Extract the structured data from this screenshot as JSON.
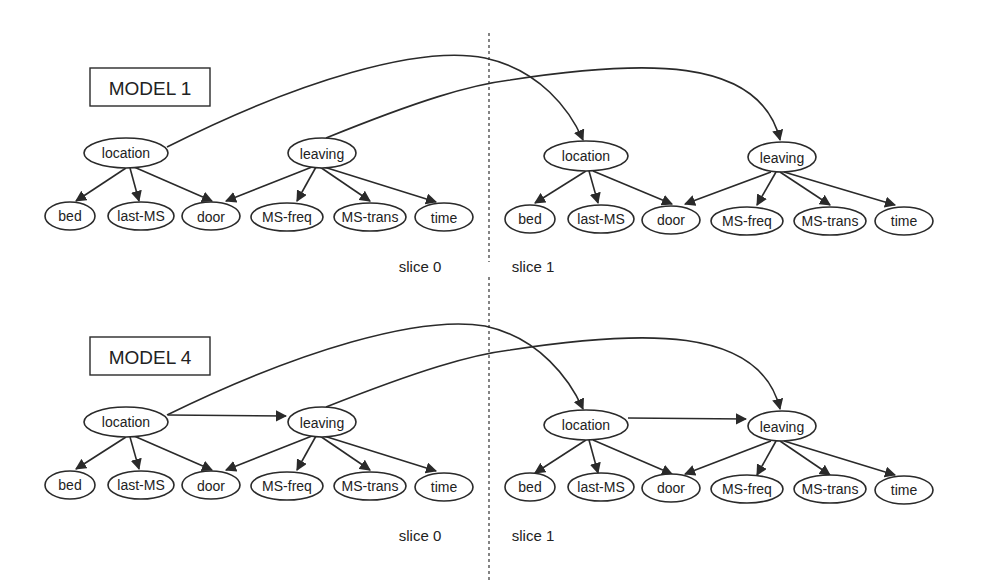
{
  "diagram": {
    "type": "dynamic-bayesian-network",
    "models": [
      {
        "id": "model1",
        "title": "MODEL 1",
        "slices": [
          {
            "label": "slice 0"
          },
          {
            "label": "slice 1"
          }
        ],
        "parent_nodes": [
          "location",
          "leaving"
        ],
        "child_nodes": [
          "bed",
          "last-MS",
          "door",
          "MS-freq",
          "MS-trans",
          "time"
        ],
        "intra_slice_edges": [
          [
            "location",
            "bed"
          ],
          [
            "location",
            "last-MS"
          ],
          [
            "location",
            "door"
          ],
          [
            "leaving",
            "door"
          ],
          [
            "leaving",
            "MS-freq"
          ],
          [
            "leaving",
            "MS-trans"
          ],
          [
            "leaving",
            "time"
          ]
        ],
        "inter_slice_edges": [
          [
            "location@0",
            "location@1"
          ],
          [
            "leaving@0",
            "leaving@1"
          ]
        ]
      },
      {
        "id": "model4",
        "title": "MODEL 4",
        "slices": [
          {
            "label": "slice 0"
          },
          {
            "label": "slice 1"
          }
        ],
        "parent_nodes": [
          "location",
          "leaving"
        ],
        "child_nodes": [
          "bed",
          "last-MS",
          "door",
          "MS-freq",
          "MS-trans",
          "time"
        ],
        "intra_slice_edges": [
          [
            "location",
            "leaving"
          ],
          [
            "location",
            "bed"
          ],
          [
            "location",
            "last-MS"
          ],
          [
            "location",
            "door"
          ],
          [
            "leaving",
            "door"
          ],
          [
            "leaving",
            "MS-freq"
          ],
          [
            "leaving",
            "MS-trans"
          ],
          [
            "leaving",
            "time"
          ]
        ],
        "inter_slice_edges": [
          [
            "location@0",
            "location@1"
          ],
          [
            "leaving@0",
            "leaving@1"
          ]
        ]
      }
    ],
    "labels": {
      "location": "location",
      "leaving": "leaving",
      "bed": "bed",
      "last_ms": "last-MS",
      "door": "door",
      "ms_freq": "MS-freq",
      "ms_trans": "MS-trans",
      "time": "time"
    }
  }
}
